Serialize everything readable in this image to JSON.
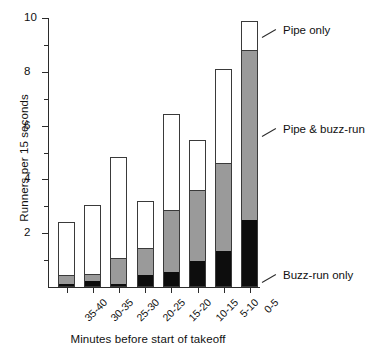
{
  "chart_data": {
    "type": "bar",
    "subtype": "stacked-bar",
    "title": "",
    "xlabel": "Minutes before start of takeoff",
    "ylabel": "Runners per 15 seconds",
    "categories": [
      "35-40",
      "30-35",
      "25-30",
      "20-25",
      "15-20",
      "10-15",
      "5-10",
      "0-5"
    ],
    "series": [
      {
        "name": "Buzz-run only",
        "color": "#0d0d0d",
        "values": [
          0.05,
          0.15,
          0.05,
          0.4,
          0.5,
          0.9,
          1.3,
          2.45
        ]
      },
      {
        "name": "Pipe & buzz-run",
        "color": "#9a9a9a",
        "values": [
          0.3,
          0.25,
          0.95,
          1.0,
          2.3,
          2.7,
          3.3,
          6.4
        ]
      },
      {
        "name": "Pipe only",
        "color": "#ffffff",
        "values": [
          2.05,
          2.65,
          3.85,
          1.8,
          3.65,
          1.85,
          3.5,
          1.05
        ]
      }
    ],
    "totals": [
      2.4,
      3.05,
      4.85,
      3.2,
      6.45,
      5.45,
      8.1,
      9.9
    ],
    "cumulative_tops": {
      "black": [
        0.05,
        0.15,
        0.05,
        0.4,
        0.5,
        0.9,
        1.3,
        2.45
      ],
      "gray": [
        0.35,
        0.4,
        1.0,
        1.4,
        2.8,
        3.6,
        4.6,
        8.85
      ],
      "white": [
        2.4,
        3.05,
        4.85,
        3.2,
        6.45,
        5.45,
        8.1,
        9.9
      ]
    },
    "ylim": [
      0,
      10
    ],
    "xlim_categories": 8,
    "ytick_major": [
      0,
      2,
      4,
      6,
      8,
      10
    ],
    "ytick_major_labels": [
      "",
      "2",
      "4",
      "6",
      "8",
      "10"
    ],
    "ytick_minor": [
      1,
      3,
      5,
      7,
      9
    ],
    "grid": false,
    "legend_position": "right-annotations"
  },
  "axes": {
    "y": {
      "label": "Runners per 15 seconds",
      "ticks": [
        {
          "value": 10,
          "label": "10",
          "type": "major"
        },
        {
          "value": 9,
          "label": "",
          "type": "minor"
        },
        {
          "value": 8,
          "label": "8",
          "type": "major"
        },
        {
          "value": 7,
          "label": "",
          "type": "minor"
        },
        {
          "value": 6,
          "label": "6",
          "type": "major"
        },
        {
          "value": 5,
          "label": "",
          "type": "minor"
        },
        {
          "value": 4,
          "label": "4",
          "type": "major"
        },
        {
          "value": 3,
          "label": "",
          "type": "minor"
        },
        {
          "value": 2,
          "label": "2",
          "type": "major"
        },
        {
          "value": 1,
          "label": "",
          "type": "minor"
        }
      ]
    },
    "x": {
      "label": "Minutes before start of takeoff",
      "ticks": [
        "35-40",
        "30-35",
        "25-30",
        "20-25",
        "15-20",
        "10-15",
        "5-10",
        "0-5"
      ]
    }
  },
  "legend": {
    "items": [
      {
        "key": "pipe_only",
        "label": "Pipe only",
        "color": "#ffffff"
      },
      {
        "key": "pipe_and_buzz",
        "label": "Pipe & buzz-run",
        "color": "#9a9a9a"
      },
      {
        "key": "buzz_run_only",
        "label": "Buzz-run only",
        "color": "#0d0d0d"
      }
    ]
  },
  "colors": {
    "axis": "#2b2b2b",
    "outline": "#3a3a3a",
    "white_segment": "#ffffff",
    "gray_segment": "#9a9a9a",
    "black_segment": "#0d0d0d",
    "background": "#ffffff",
    "text": "#111111"
  }
}
